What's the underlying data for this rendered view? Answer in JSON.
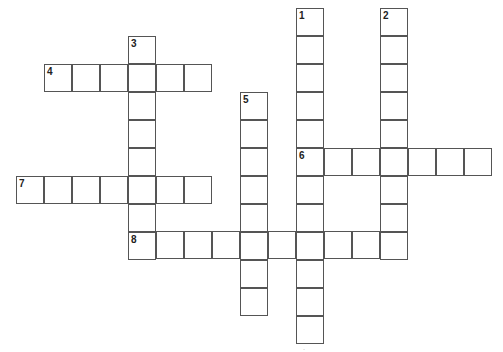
{
  "puzzle": {
    "cell_size": 28,
    "entries": [
      {
        "number": "1",
        "direction": "down",
        "x": 296,
        "y": 8,
        "length": 12
      },
      {
        "number": "2",
        "direction": "down",
        "x": 380,
        "y": 8,
        "length": 9
      },
      {
        "number": "3",
        "direction": "down",
        "x": 128,
        "y": 36,
        "length": 8
      },
      {
        "number": "4",
        "direction": "across",
        "x": 44,
        "y": 64,
        "length": 6
      },
      {
        "number": "5",
        "direction": "down",
        "x": 240,
        "y": 92,
        "length": 8
      },
      {
        "number": "6",
        "direction": "across",
        "x": 296,
        "y": 148,
        "length": 7
      },
      {
        "number": "7",
        "direction": "across",
        "x": 16,
        "y": 176,
        "length": 7
      },
      {
        "number": "8",
        "direction": "across",
        "x": 128,
        "y": 231,
        "length": 10
      }
    ]
  },
  "footer": {
    "mark": "·"
  }
}
